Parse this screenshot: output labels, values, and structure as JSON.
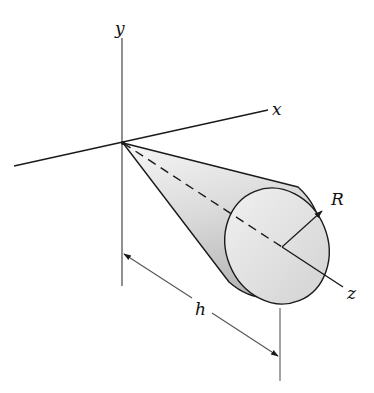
{
  "figure": {
    "labels": {
      "y_axis": "y",
      "x_axis": "x",
      "z_axis": "z",
      "radius": "R",
      "height": "h"
    },
    "colors": {
      "line": "#1a1a1a",
      "cone_light": "#f4f4f4",
      "cone_dark": "#bdbdbd",
      "base_fill": "#e6e6e6",
      "dimension_line": "#555555"
    }
  }
}
